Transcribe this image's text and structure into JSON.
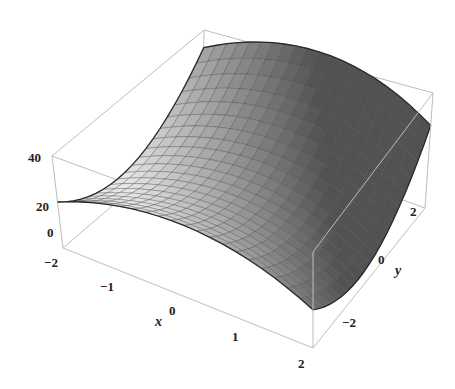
{
  "chart_data": {
    "type": "surface3d",
    "title": "",
    "function_description": "saddle surface z(x,y), concave down in x, concave up in y",
    "x": [
      -2,
      -1.5,
      -1,
      -0.5,
      0,
      0.5,
      1,
      1.5,
      2
    ],
    "y": [
      -3,
      -2.25,
      -1.5,
      -0.75,
      0,
      0.75,
      1.5,
      2.25,
      3
    ],
    "xlabel": "x",
    "ylabel": "y",
    "zlabel": "",
    "xlim": [
      -2,
      2
    ],
    "ylim": [
      -3,
      3
    ],
    "zlim": [
      -2,
      45
    ],
    "x_ticks": [
      "-2",
      "-1",
      "0",
      "1",
      "2"
    ],
    "y_ticks": [
      "-2",
      "0",
      "2"
    ],
    "z_ticks": [
      "0",
      "20",
      "40"
    ],
    "grid": false,
    "mesh": true,
    "colormap": "grayscale",
    "z_formula_coeffs": {
      "const": 22,
      "y2": 2.2,
      "y1": 2.5,
      "x2": -3.8,
      "x1": -1.2
    }
  },
  "labels": {
    "z_ticks": [
      {
        "text": "40",
        "x": 28,
        "y": 162
      },
      {
        "text": "20",
        "x": 36,
        "y": 211
      },
      {
        "text": "0",
        "x": 47,
        "y": 237
      }
    ],
    "x_ticks": [
      {
        "text": "−2",
        "x": 44,
        "y": 267
      },
      {
        "text": "−1",
        "x": 100,
        "y": 291
      },
      {
        "text": "0",
        "x": 169,
        "y": 315
      },
      {
        "text": "1",
        "x": 232,
        "y": 341
      },
      {
        "text": "2",
        "x": 298,
        "y": 368
      }
    ],
    "y_ticks": [
      {
        "text": "2",
        "x": 410,
        "y": 216
      },
      {
        "text": "0",
        "x": 378,
        "y": 264
      },
      {
        "text": "−2",
        "x": 342,
        "y": 327
      }
    ],
    "x_axis_label": {
      "text": "x",
      "x": 155,
      "y": 326
    },
    "y_axis_label": {
      "text": "y",
      "x": 395,
      "y": 275
    }
  },
  "colors": {
    "box": "#bdbdbd",
    "mesh": "#3a3a3a",
    "surface_light": "#e4e4e4",
    "surface_dark": "#5a5a5a",
    "edge": "#2a2a2a"
  }
}
